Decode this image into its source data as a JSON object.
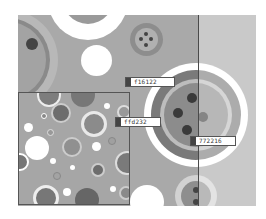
{
  "canvas": {
    "background": "#a9a9a9",
    "divider_x": 198
  },
  "color_labels": [
    {
      "hex": "f16122",
      "swatch": "#444444",
      "x": 125,
      "y": 77
    },
    {
      "hex": "ffd232",
      "swatch": "#444444",
      "x": 115,
      "y": 117
    },
    {
      "hex": "772216",
      "swatch": "#444444",
      "x": 190,
      "y": 136
    }
  ],
  "thumbnail": {
    "label": "pattern preview"
  }
}
